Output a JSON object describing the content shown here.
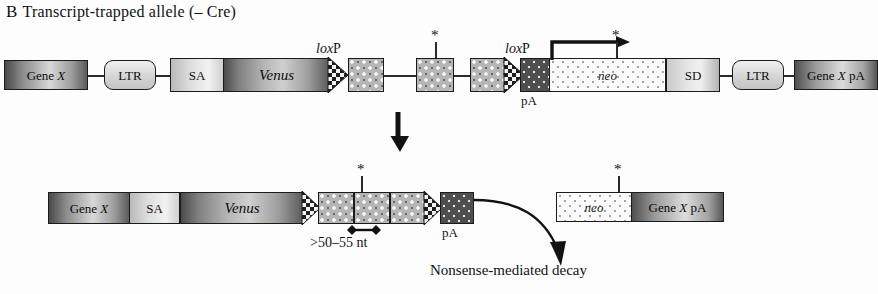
{
  "panel": {
    "letter": "B",
    "title": "Transcript-trapped allele (– Cre)"
  },
  "top_construct": {
    "name": "transcript-trapped allele map",
    "elements": [
      {
        "id": "gene-x",
        "label": "Gene X",
        "type": "gene-box"
      },
      {
        "id": "ltr-left",
        "label": "LTR",
        "type": "ltr-box"
      },
      {
        "id": "sa",
        "label": "SA",
        "type": "splice-acceptor-box"
      },
      {
        "id": "venus",
        "label": "Venus",
        "type": "reporter-box",
        "italic": true
      },
      {
        "id": "exon-1",
        "label": "",
        "type": "exon-box"
      },
      {
        "id": "exon-2",
        "label": "",
        "type": "exon-box"
      },
      {
        "id": "exon-3",
        "label": "",
        "type": "exon-box"
      },
      {
        "id": "pa",
        "label": "pA",
        "type": "polyA-box"
      },
      {
        "id": "neo",
        "label": "neo",
        "type": "selection-marker-box",
        "italic": true
      },
      {
        "id": "sd",
        "label": "SD",
        "type": "splice-donor-box"
      },
      {
        "id": "ltr-right",
        "label": "LTR",
        "type": "ltr-box"
      },
      {
        "id": "gene-x-pa",
        "label": "Gene X pA",
        "type": "gene-box"
      }
    ],
    "loxp_label_1": "loxP",
    "loxp_label_2": "loxP",
    "pa_label": "pA",
    "stop_codon_marker_1": "*",
    "stop_codon_marker_2": "*"
  },
  "transition": {
    "arrow": "down-arrow"
  },
  "bottom_left_construct": {
    "name": "trapped fusion transcript",
    "elements": [
      {
        "id": "gene-x",
        "label": "Gene X",
        "type": "gene-box"
      },
      {
        "id": "sa",
        "label": "SA",
        "type": "splice-acceptor-box"
      },
      {
        "id": "venus",
        "label": "Venus",
        "type": "reporter-box",
        "italic": true
      },
      {
        "id": "exon-1",
        "label": "",
        "type": "exon-box"
      },
      {
        "id": "exon-2",
        "label": "",
        "type": "exon-box"
      },
      {
        "id": "exon-3",
        "label": "",
        "type": "exon-box"
      },
      {
        "id": "pa",
        "label": "pA",
        "type": "polyA-box"
      }
    ],
    "pa_label": "pA",
    "distance_label": ">50–55 nt",
    "stop_codon_marker": "*"
  },
  "bottom_right_construct": {
    "name": "neo gene X pA transcript",
    "elements": [
      {
        "id": "neo",
        "label": "neo",
        "type": "selection-marker-box",
        "italic": true
      },
      {
        "id": "gene-x-pa",
        "label": "Gene X pA",
        "type": "gene-box"
      }
    ],
    "stop_codon_marker": "*"
  },
  "outcome": {
    "caption": "Nonsense-mediated decay",
    "arrow": "curved-arrow"
  },
  "colors": {
    "ink": "#111111",
    "line": "#2a2a2a",
    "background": "#fdfdfd"
  }
}
